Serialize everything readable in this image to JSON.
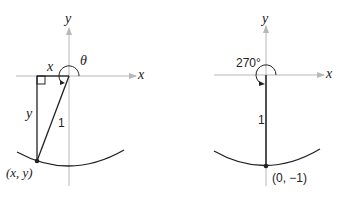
{
  "left_diagram": {
    "axis_labels": {
      "x": "x",
      "y": "y"
    },
    "angle_label": "θ",
    "leg_horizontal_label": "x",
    "leg_vertical_label": "y",
    "hypotenuse_label": "1",
    "point_label": "(x, y)"
  },
  "right_diagram": {
    "axis_labels": {
      "x": "x",
      "y": "y"
    },
    "angle_label": "270°",
    "radius_label": "1",
    "point_label": "(0, −1)"
  },
  "colors": {
    "axis": "#b8b8b8",
    "line": "#222222"
  }
}
